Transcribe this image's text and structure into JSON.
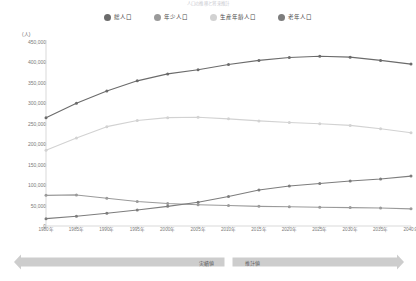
{
  "title_fragment": "人口の推移と将来推計",
  "legend": {
    "items": [
      {
        "label": "総人口",
        "color": "#6b6b6b",
        "icon": "series-dot-icon"
      },
      {
        "label": "年少人口",
        "color": "#9a9a9a",
        "icon": "series-dot-icon"
      },
      {
        "label": "生産年齢人口",
        "color": "#d2d2d2",
        "icon": "series-dot-icon"
      },
      {
        "label": "老年人口",
        "color": "#7d7d7d",
        "icon": "series-dot-icon"
      }
    ]
  },
  "axis": {
    "y_unit": "(人)",
    "y_ticks": [
      "450,000",
      "400,000",
      "350,000",
      "300,000",
      "250,000",
      "200,000",
      "150,000",
      "100,000",
      "50,000",
      "0"
    ],
    "x_ticks": [
      "1980年",
      "1985年",
      "1990年",
      "1995年",
      "2000年",
      "2005年",
      "2010年",
      "2015年",
      "2020年",
      "2025年",
      "2030年",
      "2035年",
      "2040年"
    ]
  },
  "annotations": {
    "actual_label": "実績値",
    "estimate_label": "推計値"
  },
  "chart_data": {
    "type": "line",
    "title": "人口の推移と将来推計",
    "xlabel": "",
    "ylabel": "(人)",
    "ylim": [
      0,
      450000
    ],
    "ytick_step": 50000,
    "grid": false,
    "legend_position": "top-center",
    "x": [
      1980,
      1985,
      1990,
      1995,
      2000,
      2005,
      2010,
      2015,
      2020,
      2025,
      2030,
      2035,
      2040
    ],
    "categories": [
      "1980年",
      "1985年",
      "1990年",
      "1995年",
      "2000年",
      "2005年",
      "2010年",
      "2015年",
      "2020年",
      "2025年",
      "2030年",
      "2035年",
      "2040年"
    ],
    "series": [
      {
        "name": "総人口",
        "color": "#6b6b6b",
        "values": [
          265000,
          300000,
          330000,
          355000,
          372000,
          382000,
          395000,
          405000,
          412000,
          415000,
          413000,
          405000,
          396000
        ]
      },
      {
        "name": "年少人口",
        "color": "#9a9a9a",
        "values": [
          75000,
          76000,
          68000,
          60000,
          55000,
          52000,
          50000,
          48000,
          47000,
          46000,
          45000,
          44000,
          42000
        ]
      },
      {
        "name": "生産年齢人口",
        "color": "#d2d2d2",
        "values": [
          185000,
          215000,
          243000,
          258000,
          265000,
          266000,
          262000,
          257000,
          253000,
          250000,
          246000,
          238000,
          228000
        ]
      },
      {
        "name": "老年人口",
        "color": "#7d7d7d",
        "values": [
          18000,
          24000,
          31000,
          39000,
          48000,
          58000,
          72000,
          88000,
          98000,
          104000,
          110000,
          115000,
          122000
        ]
      }
    ],
    "annotations": [
      {
        "text": "実績値",
        "x_range": [
          1980,
          2010
        ]
      },
      {
        "text": "推計値",
        "x_range": [
          2010,
          2040
        ]
      }
    ]
  }
}
